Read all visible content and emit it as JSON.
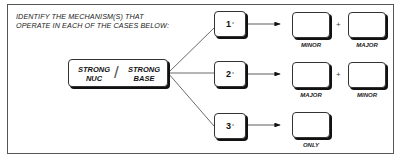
{
  "prompt": {
    "line1": "IDENTIFY THE MECHANISM(S) THAT",
    "line2": "OPERATE IN EACH OF THE CASES BELOW:"
  },
  "center": {
    "left_line1": "STRONG",
    "left_line2": "NUC",
    "slash": "/",
    "right_line1": "STRONG",
    "right_line2": "BASE"
  },
  "cases": [
    {
      "degree": "1",
      "symbol": "°",
      "answers": [
        "MINOR",
        "MAJOR"
      ],
      "plus": "+"
    },
    {
      "degree": "2",
      "symbol": "°",
      "answers": [
        "MAJOR",
        "MINOR"
      ],
      "plus": "+"
    },
    {
      "degree": "3",
      "symbol": "°",
      "answers": [
        "ONLY"
      ]
    }
  ]
}
